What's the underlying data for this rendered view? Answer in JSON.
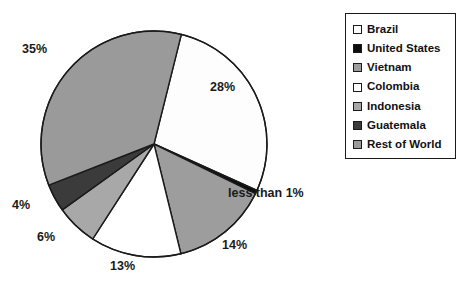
{
  "chart_data": {
    "type": "pie",
    "title": "",
    "categories": [
      "Brazil",
      "United States",
      "Vietnam",
      "Colombia",
      "Indonesia",
      "Guatemala",
      "Rest of World"
    ],
    "values": [
      28,
      0.5,
      14,
      13,
      6,
      4,
      35
    ],
    "value_labels": [
      "28%",
      "less than 1%",
      "14%",
      "13%",
      "6%",
      "4%",
      "35%"
    ],
    "colors": [
      "#fdfdfd",
      "#0d0d0d",
      "#9d9d9d",
      "#ffffff",
      "#a8a8a8",
      "#3b3b3b",
      "#9a9a9a"
    ],
    "legend_position": "right",
    "grid": false,
    "xlabel": "",
    "ylabel": ""
  },
  "legend": {
    "items": [
      {
        "label": "Brazil",
        "color": "#fdfdfd"
      },
      {
        "label": "United States",
        "color": "#0d0d0d"
      },
      {
        "label": "Vietnam",
        "color": "#9d9d9d"
      },
      {
        "label": "Colombia",
        "color": "#ffffff"
      },
      {
        "label": "Indonesia",
        "color": "#a8a8a8"
      },
      {
        "label": "Guatemala",
        "color": "#3b3b3b"
      },
      {
        "label": "Rest of World",
        "color": "#9a9a9a"
      }
    ]
  },
  "labels": {
    "brazil": "28%",
    "united_states": "less than 1%",
    "vietnam": "14%",
    "colombia": "13%",
    "indonesia": "6%",
    "guatemala": "4%",
    "rest_of_world": "35%"
  },
  "style": {
    "outline": "#1a1a1a",
    "background": "#ffffff"
  }
}
